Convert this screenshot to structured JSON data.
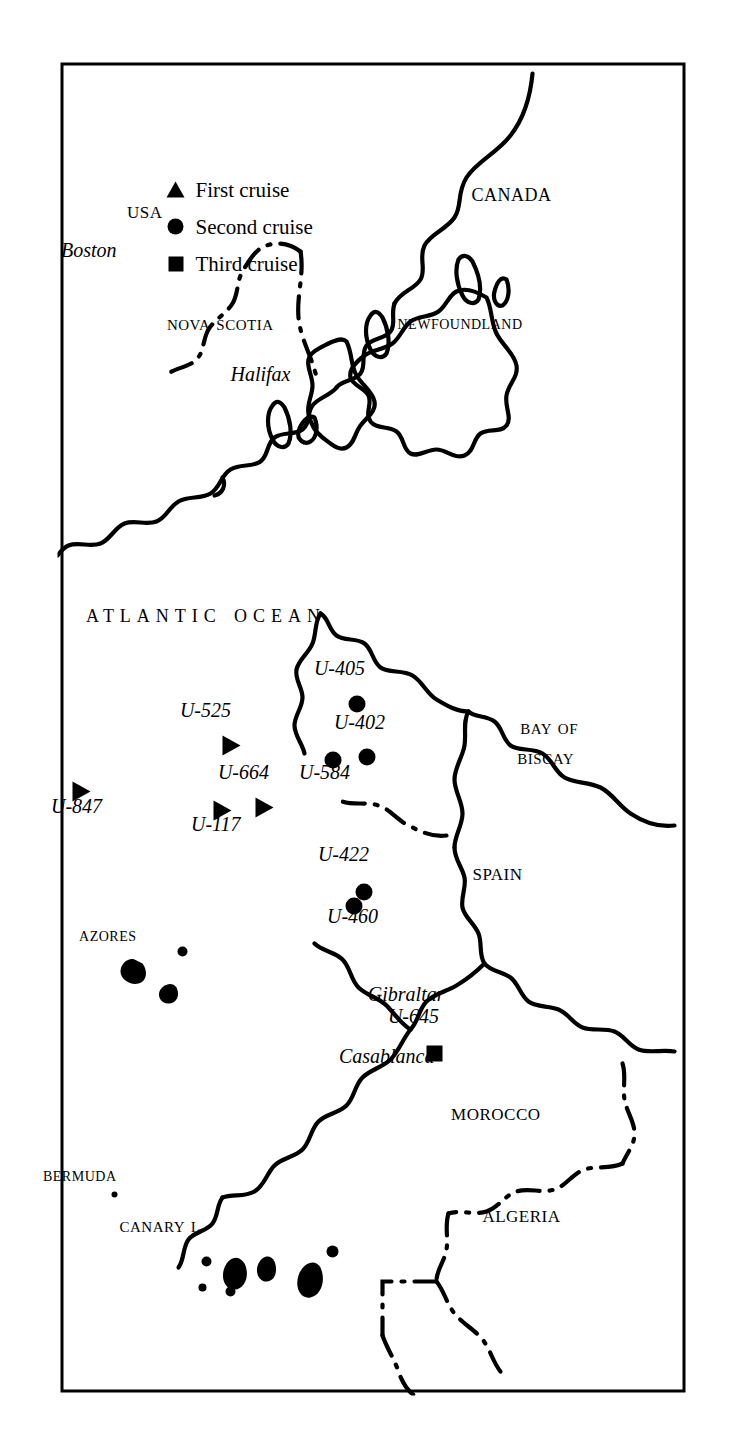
{
  "figure": {
    "kind": "map",
    "title": "",
    "orientation": "rotated-90-cw",
    "background_color": "#ffffff",
    "ink_color": "#000000",
    "border_color": "#000000"
  },
  "ocean_label": "Atlantic Ocean",
  "regions": [
    {
      "id": "canada",
      "label": "Canada",
      "style": "small-caps"
    },
    {
      "id": "usa",
      "label": "USA",
      "style": "small-caps"
    },
    {
      "id": "newfoundland",
      "label": "Newfoundland",
      "style": "small-caps"
    },
    {
      "id": "nova-scotia",
      "label": "Nova Scotia",
      "style": "small-caps"
    },
    {
      "id": "spain",
      "label": "Spain",
      "style": "small-caps"
    },
    {
      "id": "morocco",
      "label": "Morocco",
      "style": "small-caps"
    },
    {
      "id": "algeria",
      "label": "Algeria",
      "style": "small-caps"
    },
    {
      "id": "bay-of-biscay",
      "label": "Bay of\nBiscay",
      "style": "small-caps"
    },
    {
      "id": "canary-islands",
      "label": "Canary I.",
      "style": "small-caps"
    },
    {
      "id": "azores",
      "label": "Azores",
      "style": "small-caps"
    },
    {
      "id": "bermuda",
      "label": "Bermuda",
      "style": "small-caps"
    }
  ],
  "cities": [
    {
      "id": "boston",
      "label": "Boston",
      "style": "italic"
    },
    {
      "id": "halifax",
      "label": "Halifax",
      "style": "italic"
    },
    {
      "id": "gibraltar",
      "label": "Gibraltar",
      "style": "italic"
    },
    {
      "id": "casablanca",
      "label": "Casablanca",
      "style": "italic"
    }
  ],
  "legend": {
    "items": [
      {
        "symbol": "triangle",
        "label": "First cruise"
      },
      {
        "symbol": "circle",
        "label": "Second cruise"
      },
      {
        "symbol": "square",
        "label": "Third cruise"
      }
    ]
  },
  "markers": [
    {
      "id": "u-405",
      "label": "U-405",
      "symbol": "circle",
      "cruise": "Second cruise"
    },
    {
      "id": "u-402",
      "label": "U-402",
      "symbol": "circle",
      "cruise": "Second cruise"
    },
    {
      "id": "u-584",
      "label": "U-584",
      "symbol": "circle",
      "cruise": "Second cruise"
    },
    {
      "id": "u-422",
      "label": "U-422",
      "symbol": "circle",
      "cruise": "Second cruise"
    },
    {
      "id": "u-460",
      "label": "U-460",
      "symbol": "circle",
      "cruise": "Second cruise"
    },
    {
      "id": "u-645",
      "label": "U-645",
      "symbol": "square",
      "cruise": "Third cruise"
    },
    {
      "id": "u-525",
      "label": "U-525",
      "symbol": "triangle",
      "cruise": "First cruise"
    },
    {
      "id": "u-664",
      "label": "U-664",
      "symbol": "triangle",
      "cruise": "First cruise"
    },
    {
      "id": "u-117",
      "label": "U-117",
      "symbol": "triangle",
      "cruise": "First cruise"
    },
    {
      "id": "u-847",
      "label": "U-847",
      "symbol": "triangle",
      "cruise": "First cruise"
    }
  ]
}
